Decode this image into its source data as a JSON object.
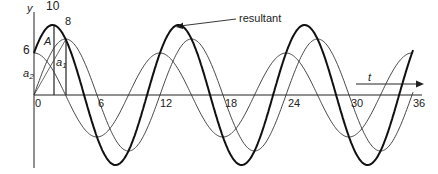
{
  "diagram": {
    "axis_y_label": "y",
    "axis_t_label": "t",
    "resultant_label": "resultant",
    "amplitude_label": "A",
    "a1_label": "a",
    "a1_sub": "1",
    "a2_label": "a",
    "a2_sub": "2",
    "y_values": {
      "resultant_peak": "10",
      "a1_peak": "8",
      "a2_start": "6"
    },
    "t_ticks": [
      "0",
      "6",
      "12",
      "18",
      "24",
      "30",
      "36"
    ],
    "period": 12,
    "curves": [
      {
        "name": "a1",
        "amplitude": 8,
        "phase_deg": -90,
        "stroke": "#333333",
        "width": 0.9
      },
      {
        "name": "a2",
        "amplitude": 6,
        "phase_deg": 0,
        "stroke": "#333333",
        "width": 0.9
      },
      {
        "name": "resultant",
        "amplitude": 10,
        "phase_deg": -53.13,
        "stroke": "#111111",
        "width": 2
      }
    ]
  }
}
